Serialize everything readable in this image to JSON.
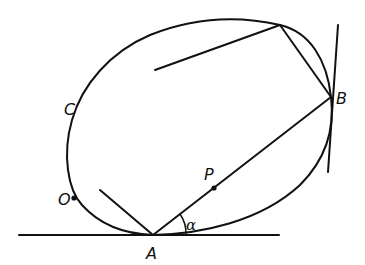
{
  "diagram": {
    "type": "geometry",
    "labels": {
      "A": "A",
      "B": "B",
      "C": "C",
      "O": "O",
      "P": "P",
      "alpha": "α"
    },
    "colors": {
      "stroke": "#111111",
      "background": "#ffffff"
    },
    "points": {
      "A": [
        153,
        235
      ],
      "B": [
        331,
        97
      ],
      "P": [
        214,
        188
      ],
      "O": [
        74,
        198
      ],
      "top_vertex": [
        280,
        25
      ]
    }
  }
}
